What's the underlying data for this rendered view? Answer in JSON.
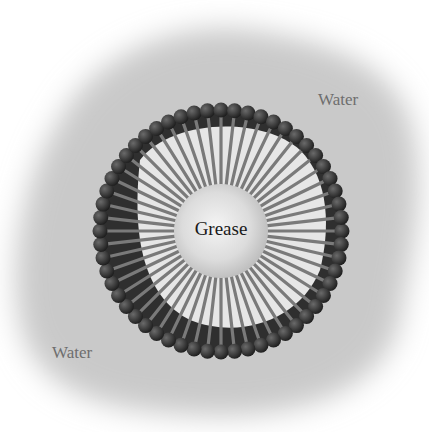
{
  "figure": {
    "labels": {
      "water_top_right": "Water",
      "water_bottom_left": "Water",
      "core": "Grease"
    },
    "colors": {
      "background": "#ffffff",
      "water_cloud": "#c8c8c8",
      "head_group": "#2a2a2a",
      "tail": "#7a7a7a",
      "tail_gap": "#e8e8e8",
      "grease_core": "#e2e2e2",
      "label_text": "#6e6e6e",
      "core_text": "#1a1a1a"
    },
    "micelle": {
      "center": [
        221,
        231
      ],
      "outer_radius": 127,
      "core_radius": 47,
      "molecule_count": 56
    }
  }
}
